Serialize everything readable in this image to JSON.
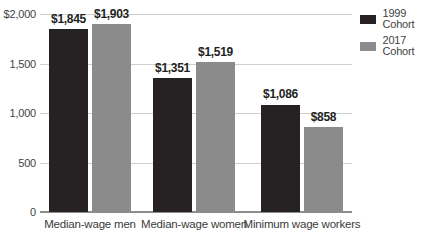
{
  "chart_data": {
    "type": "bar",
    "title": "",
    "categories": [
      "Median-wage men",
      "Median-wage women",
      "Minimum wage workers"
    ],
    "series": [
      {
        "name": "1999 Cohort",
        "color": "#262223",
        "values": [
          1845,
          1351,
          1086
        ],
        "value_labels": [
          "$1,845",
          "$1,351",
          "$1,086"
        ]
      },
      {
        "name": "2017 Cohort",
        "color": "#8b8b8b",
        "values": [
          1903,
          1519,
          858
        ],
        "value_labels": [
          "$1,903",
          "$1,519",
          "$858"
        ]
      }
    ],
    "xlabel": "",
    "ylabel": "",
    "y_axis": {
      "min": 0,
      "max": 2000,
      "ticks": [
        0,
        500,
        1000,
        1500,
        2000
      ],
      "tick_labels": [
        "0",
        "500",
        "1,000",
        "1,500",
        "$2,000"
      ]
    },
    "grid": true,
    "legend_position": "top-right"
  },
  "colors": {
    "background": "#ffffff",
    "gridline": "#cfcfcf",
    "axis_line": "#8c8c8c",
    "text": "#3f3f3f",
    "value_label_text": "#231f20",
    "series_1999": "#262223",
    "series_2017": "#8b8b8b"
  }
}
